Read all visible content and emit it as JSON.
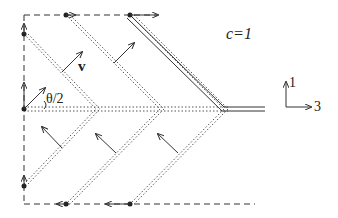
{
  "labels": {
    "speed_of_light": "c=1",
    "velocity": "v",
    "angle": "θ/2",
    "axis_vertical": "1",
    "axis_horizontal": "3"
  },
  "colors": {
    "stroke": "#333333",
    "background": "#ffffff"
  }
}
